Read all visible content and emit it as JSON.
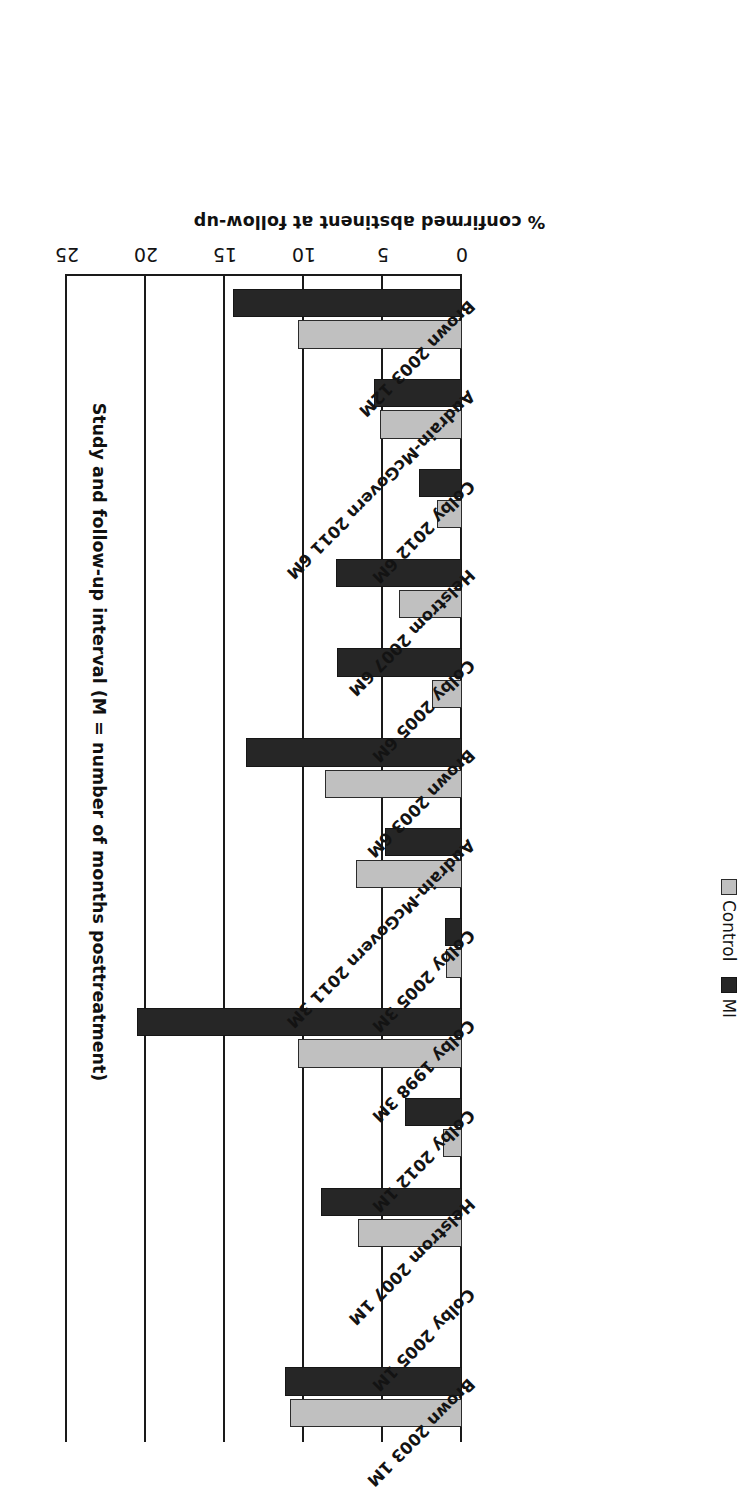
{
  "chart_data": {
    "type": "bar",
    "orientation": "horizontal",
    "title": "",
    "xlabel": "Study and follow-up interval (M = number of months posttreatment)",
    "ylabel": "% confirmed abstinent at follow-up",
    "value_axis_label": "% confirmed abstinent at follow-up",
    "category_axis_label": "Study and follow-up interval (M = number of months posttreatment)",
    "ylim": [
      0,
      25
    ],
    "value_ticks": [
      "0",
      "5",
      "10",
      "15",
      "20",
      "25"
    ],
    "value_tick_numbers": [
      0,
      5,
      10,
      15,
      20,
      25
    ],
    "grid": true,
    "legend_position": "top-left",
    "categories": [
      "Brown 2003 1M",
      "Colby 2005 1M",
      "Helstrom 2007 1M",
      "Colby 2012 1M",
      "Colby 1998 3M",
      "Colby 2005 3M",
      "Audrain-McGovern 2011 3M",
      "Brown 2003 6M",
      "Colby 2005 6M",
      "Helstrom 2007 6M",
      "Colby 2012 6M",
      "Audrain-McGovern 2011 6M",
      "Brown 2003 12M"
    ],
    "series": [
      {
        "name": "Control",
        "color": "#c0c0c0",
        "values": [
          10.9,
          0,
          6.6,
          1.2,
          10.4,
          1.0,
          6.7,
          8.7,
          1.9,
          4.0,
          1.6,
          5.2,
          10.4
        ]
      },
      {
        "name": "MI",
        "color": "#262626",
        "values": [
          11.2,
          0,
          8.9,
          3.6,
          20.6,
          1.1,
          4.9,
          13.7,
          7.9,
          8.0,
          2.7,
          5.6,
          14.5
        ]
      }
    ]
  },
  "legend": {
    "items": [
      {
        "label": "Control",
        "swatch": "control-swatch"
      },
      {
        "label": "MI",
        "swatch": "mi-swatch"
      }
    ]
  },
  "axis": {
    "value_title": "% confirmed abstinent at follow-up",
    "category_title": "Study and follow-up interval (M = number of months posttreatment)"
  }
}
